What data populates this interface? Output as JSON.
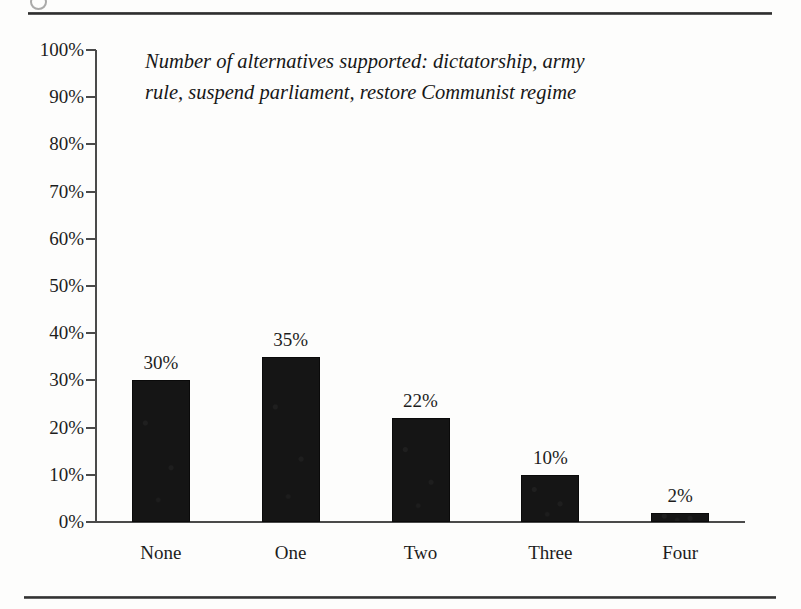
{
  "figure": {
    "title": "Number of alternatives supported: dictatorship, army rule, suspend parliament, restore Communist regime",
    "title_line_1": "Number of alternatives supported: dictatorship, army",
    "title_line_2": "rule, suspend parliament, restore Communist regime"
  },
  "chart_data": {
    "type": "bar",
    "title": "Number of alternatives supported: dictatorship, army rule, suspend parliament, restore Communist regime",
    "categories": [
      "None",
      "One",
      "Two",
      "Three",
      "Four"
    ],
    "values": [
      30,
      35,
      22,
      10,
      2
    ],
    "value_labels": [
      "30%",
      "35%",
      "22%",
      "10%",
      "2%"
    ],
    "xlabel": "",
    "ylabel": "",
    "ylim": [
      0,
      100
    ],
    "ytick_values": [
      100,
      90,
      80,
      70,
      60,
      50,
      40,
      30,
      20,
      10,
      0
    ],
    "ytick_labels": [
      "100%",
      "90%",
      "80%",
      "70%",
      "60%",
      "50%",
      "40%",
      "30%",
      "20%",
      "10%",
      "0%"
    ],
    "grid": false,
    "legend": false,
    "bar_color": "#151515",
    "axis_color": "#4a4a4a"
  }
}
